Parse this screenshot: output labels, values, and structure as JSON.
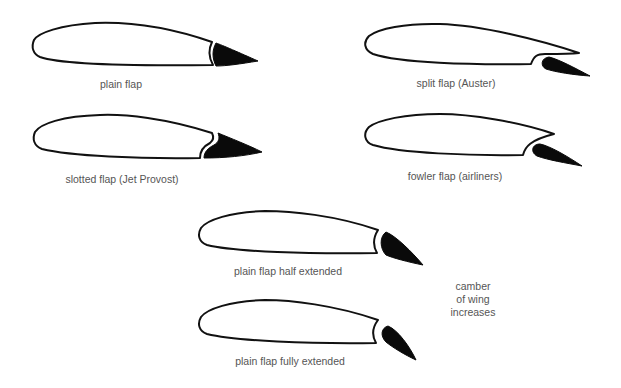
{
  "colors": {
    "outline": "#111111",
    "flap_fill": "#0a0a0a",
    "label_text": "#555555",
    "background": "#ffffff"
  },
  "diagrams": [
    {
      "id": "plain",
      "label": "plain flap"
    },
    {
      "id": "split",
      "label": "split flap (Auster)"
    },
    {
      "id": "slotted",
      "label": "slotted flap (Jet Provost)"
    },
    {
      "id": "fowler",
      "label": "fowler flap (airliners)"
    },
    {
      "id": "plain-half",
      "label": "plain flap half extended"
    },
    {
      "id": "plain-full",
      "label": "plain flap fully extended"
    }
  ],
  "annotation": {
    "lines": [
      "camber",
      "of wing",
      "increases"
    ]
  }
}
